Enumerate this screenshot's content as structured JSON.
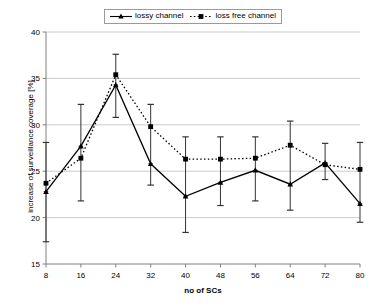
{
  "chart_data": {
    "type": "line",
    "title": "",
    "subtitle": "",
    "xlabel": "no of SCs",
    "ylabel": "increase of surveillance coverage [%]",
    "x": [
      8,
      16,
      24,
      32,
      40,
      48,
      56,
      64,
      72,
      80
    ],
    "xtick_labels": [
      "8",
      "16",
      "24",
      "32",
      "40",
      "48",
      "56",
      "64",
      "72",
      "80"
    ],
    "ytick_labels": [
      "15",
      "20",
      "25",
      "30",
      "35",
      "40"
    ],
    "yticks": [
      15,
      20,
      25,
      30,
      35,
      40
    ],
    "xlim": [
      8,
      80
    ],
    "ylim": [
      15,
      40
    ],
    "grid": "horizontal",
    "legend_position": "top-center",
    "series": [
      {
        "name": "lossy channel",
        "style": "solid",
        "marker": "triangle",
        "color": "#000000",
        "values": [
          22.8,
          27.7,
          34.3,
          25.8,
          22.3,
          23.8,
          25.1,
          23.6,
          25.9,
          21.5
        ],
        "err_low": [
          17.4,
          21.8,
          30.8,
          23.5,
          18.4,
          21.3,
          21.8,
          20.8,
          24.1,
          19.5
        ],
        "err_high": [
          28.1,
          32.2,
          37.6,
          32.2,
          28.7,
          28.7,
          28.7,
          30.4,
          28.0,
          28.1
        ]
      },
      {
        "name": "loss free channel",
        "style": "dotted",
        "marker": "square",
        "color": "#000000",
        "values": [
          23.7,
          26.4,
          35.4,
          29.8,
          26.3,
          26.3,
          26.4,
          27.8,
          25.7,
          25.2
        ]
      }
    ]
  },
  "legend": {
    "entries": [
      {
        "label": "lossy channel"
      },
      {
        "label": "loss free channel"
      }
    ]
  },
  "axes": {
    "x_title": "no of SCs",
    "y_title": "increase of surveillance coverage [%]"
  }
}
